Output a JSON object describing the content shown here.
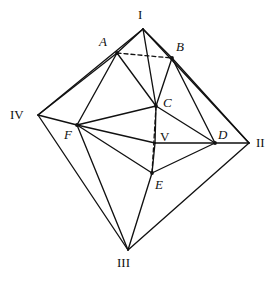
{
  "figure": {
    "name": "octahedron-net-diagram",
    "background_color": "#ffffff",
    "stroke_color": "#111111",
    "width": 280,
    "height": 282
  },
  "vertices": [
    {
      "id": "I",
      "label": "I",
      "style": "roman",
      "x": 143,
      "y": 29,
      "label_x": 138,
      "label_y": 8,
      "dot": false
    },
    {
      "id": "II",
      "label": "II",
      "style": "roman",
      "x": 249,
      "y": 143,
      "label_x": 256,
      "label_y": 136,
      "dot": false
    },
    {
      "id": "III",
      "label": "III",
      "style": "roman",
      "x": 128,
      "y": 250,
      "label_x": 117,
      "label_y": 256,
      "dot": false
    },
    {
      "id": "IV",
      "label": "IV",
      "style": "roman",
      "x": 38,
      "y": 115,
      "label_x": 10,
      "label_y": 108,
      "dot": false
    },
    {
      "id": "A",
      "label": "A",
      "style": "italic",
      "x": 117,
      "y": 53,
      "label_x": 99,
      "label_y": 35,
      "dot": true
    },
    {
      "id": "B",
      "label": "B",
      "style": "italic",
      "x": 172,
      "y": 58,
      "label_x": 176,
      "label_y": 40,
      "dot": true
    },
    {
      "id": "C",
      "label": "C",
      "style": "italic",
      "x": 156,
      "y": 106,
      "label_x": 163,
      "label_y": 96,
      "dot": true
    },
    {
      "id": "D",
      "label": "D",
      "style": "italic",
      "x": 215,
      "y": 143,
      "label_x": 218,
      "label_y": 128,
      "dot": true
    },
    {
      "id": "E",
      "label": "E",
      "style": "italic",
      "x": 152,
      "y": 173,
      "label_x": 155,
      "label_y": 178,
      "dot": true
    },
    {
      "id": "F",
      "label": "F",
      "style": "italic",
      "x": 77,
      "y": 125,
      "label_x": 64,
      "label_y": 128,
      "dot": true
    },
    {
      "id": "V",
      "label": "V",
      "style": "roman",
      "x": 155,
      "y": 143,
      "label_x": 160,
      "label_y": 130,
      "dot": false
    }
  ],
  "edges_solid": [
    {
      "from": "I",
      "to": "A"
    },
    {
      "from": "I",
      "to": "B"
    },
    {
      "from": "I",
      "to": "C"
    },
    {
      "from": "I",
      "to": "IV"
    },
    {
      "from": "I",
      "to": "II"
    },
    {
      "from": "IV",
      "to": "A"
    },
    {
      "from": "IV",
      "to": "F"
    },
    {
      "from": "IV",
      "to": "III"
    },
    {
      "from": "II",
      "to": "B"
    },
    {
      "from": "II",
      "to": "D"
    },
    {
      "from": "II",
      "to": "III"
    },
    {
      "from": "III",
      "to": "E"
    },
    {
      "from": "III",
      "to": "F"
    },
    {
      "from": "A",
      "to": "C"
    },
    {
      "from": "A",
      "to": "F"
    },
    {
      "from": "B",
      "to": "C"
    },
    {
      "from": "B",
      "to": "D"
    },
    {
      "from": "C",
      "to": "F"
    },
    {
      "from": "C",
      "to": "D"
    },
    {
      "from": "C",
      "to": "V"
    },
    {
      "from": "F",
      "to": "V"
    },
    {
      "from": "F",
      "to": "E"
    },
    {
      "from": "V",
      "to": "D"
    },
    {
      "from": "V",
      "to": "E"
    },
    {
      "from": "E",
      "to": "D"
    }
  ],
  "edges_dashed": [
    {
      "from": "A",
      "to": "B"
    },
    {
      "from": "C",
      "to": "E"
    }
  ]
}
